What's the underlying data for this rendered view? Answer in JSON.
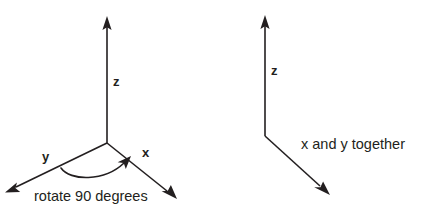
{
  "figure": {
    "title": "",
    "background_color": "#ffffff",
    "line_color": "#231f20"
  },
  "left_diagram": {
    "name": "three-axis-coordinate-frame",
    "z_axis_label": "z",
    "y_axis_label": "y",
    "x_axis_label": "x",
    "rotation_annotation": "rotate 90 degrees"
  },
  "right_diagram": {
    "name": "collapsed-axis-frame",
    "z_axis_label": "z",
    "xy_axis_label": "x and y together"
  }
}
